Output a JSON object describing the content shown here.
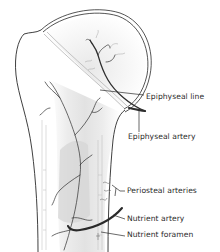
{
  "figure": {
    "colors": {
      "outline": "#2a2a2a",
      "artery": "#2e2e2e",
      "shaft_fill": "#e9e9e9",
      "marrow_fill": "#d3d3d3",
      "epiphysis_fill": "#f3f3f3",
      "vessel_faint": "#9a9a9a"
    }
  },
  "labels": [
    {
      "id": "epiphyseal-line",
      "text": "Epiphyseal line",
      "x": 146,
      "y": 97
    },
    {
      "id": "epiphyseal-artery",
      "text": "Epiphyseal artery",
      "x": 128,
      "y": 136
    },
    {
      "id": "periosteal-arteries",
      "text": "Periosteal arteries",
      "x": 127,
      "y": 193
    },
    {
      "id": "nutrient-artery",
      "text": "Nutrient artery",
      "x": 127,
      "y": 221
    },
    {
      "id": "nutrient-foramen",
      "text": "Nutrient foramen",
      "x": 127,
      "y": 237
    }
  ]
}
